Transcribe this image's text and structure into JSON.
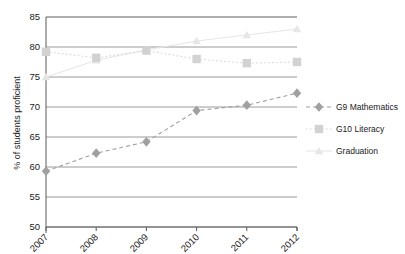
{
  "chart_data": {
    "type": "line",
    "title": "",
    "xlabel": "",
    "ylabel": "% of students proficient",
    "categories": [
      "2007",
      "2008",
      "2009",
      "2010",
      "2011",
      "2012"
    ],
    "ylim": [
      50,
      85
    ],
    "yticks": [
      50,
      55,
      60,
      65,
      70,
      75,
      80,
      85
    ],
    "grid": true,
    "legend_position": "right",
    "series": [
      {
        "name": "G9 Mathematics",
        "values": [
          59.3,
          62.3,
          64.2,
          69.4,
          70.3,
          72.3
        ],
        "color": "#a0a0a0",
        "marker": "diamond",
        "linestyle": "dashed"
      },
      {
        "name": "G10 Literacy",
        "values": [
          79.2,
          78.2,
          79.4,
          78.0,
          77.3,
          77.5
        ],
        "color": "#d2d2d2",
        "marker": "square",
        "linestyle": "dotted"
      },
      {
        "name": "Graduation",
        "values": [
          75.0,
          77.8,
          79.5,
          81.0,
          82.0,
          83.0
        ],
        "color": "#e6e6e6",
        "marker": "triangle",
        "linestyle": "solid"
      }
    ]
  },
  "axes": {
    "ytick_labels": [
      "85",
      "80",
      "75",
      "70",
      "65",
      "60",
      "55",
      "50"
    ],
    "xtick_labels": [
      "2007",
      "2008",
      "2009",
      "2010",
      "2011",
      "2012"
    ],
    "y_axis_title": "% of students proficient"
  },
  "legend": {
    "items": [
      {
        "label": "G9 Mathematics"
      },
      {
        "label": "G10 Literacy"
      },
      {
        "label": "Graduation"
      }
    ]
  },
  "colors": {
    "series_math": "#a0a0a0",
    "series_literacy": "#d2d2d2",
    "series_graduation": "#e6e6e6",
    "grid": "#808080",
    "axis": "#5a5a5a",
    "text": "#1a1a1a",
    "background": "#ffffff"
  }
}
